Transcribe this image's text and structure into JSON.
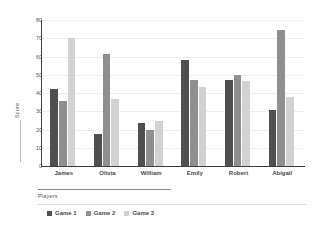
{
  "chart_data": {
    "type": "bar",
    "title": "",
    "subtitle": "",
    "xlabel": "Players",
    "ylabel": "Score",
    "categories": [
      "James",
      "Olivia",
      "William",
      "Emily",
      "Robert",
      "Abigail"
    ],
    "series": [
      {
        "name": "Game 1",
        "color": "#4f4f4f",
        "values": [
          42.3,
          17.5,
          23.6,
          58.0,
          47.2,
          30.8
        ]
      },
      {
        "name": "Game 2",
        "color": "#8f8f8f",
        "values": [
          35.4,
          61.3,
          19.6,
          47.1,
          49.8,
          74.3
        ]
      },
      {
        "name": "Game 3",
        "color": "#d2d2d2",
        "values": [
          70.4,
          36.7,
          24.7,
          43.1,
          46.7,
          38.0
        ]
      }
    ],
    "ylim": [
      0,
      80
    ],
    "yticks": [
      0,
      10,
      20,
      30,
      40,
      50,
      60,
      70,
      80
    ],
    "ytick_labels": [
      "0",
      "10",
      "20",
      "30",
      "40",
      "50",
      "60",
      "70",
      "80"
    ],
    "grid": true,
    "grid_color": "#eceef0",
    "legend_position": "bottom-left",
    "axis_color": "#3c3c3c",
    "background": "#ffffff"
  }
}
